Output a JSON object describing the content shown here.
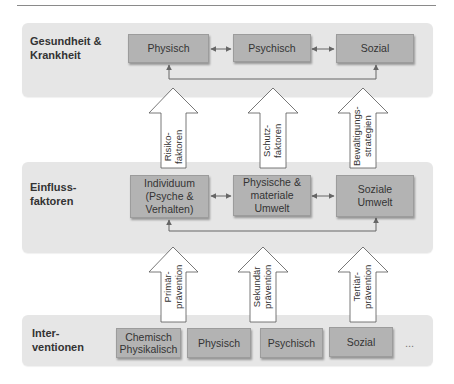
{
  "diagram": {
    "levels": [
      {
        "label": "Gesundheit &\nKrankheit",
        "label_lines": [
          "Gesundheit &",
          "Krankheit"
        ],
        "boxes": [
          "Physisch",
          "Psychisch",
          "Sozial"
        ]
      },
      {
        "label_lines": [
          "Einfluss-",
          "faktoren"
        ],
        "boxes": [
          [
            "Individuum",
            "(Psyche &",
            "Verhalten)"
          ],
          [
            "Physische &",
            "materiale",
            "Umwelt"
          ],
          [
            "Soziale",
            "Umwelt"
          ]
        ]
      },
      {
        "label_lines": [
          "Inter-",
          "ventionen"
        ],
        "boxes": [
          [
            "Chemisch",
            "Physikalisch"
          ],
          [
            "Physisch"
          ],
          [
            "Psychisch"
          ],
          [
            "Sozial"
          ]
        ],
        "more": "..."
      }
    ],
    "upper_arrows": [
      [
        "Risiko-",
        "faktoren"
      ],
      [
        "Schutz-",
        "faktoren"
      ],
      [
        "Bewältigungs-",
        "strategien"
      ]
    ],
    "lower_arrows": [
      [
        "Primär-",
        "prävention"
      ],
      [
        "Sekundär",
        "prävention"
      ],
      [
        "Tertiär-",
        "prävention"
      ]
    ],
    "colors": {
      "panel": "#e6e6e6",
      "box": "#b3b3b3",
      "connector": "#666666",
      "arrow_fill": "#ffffff",
      "arrow_stroke": "#555555"
    }
  }
}
